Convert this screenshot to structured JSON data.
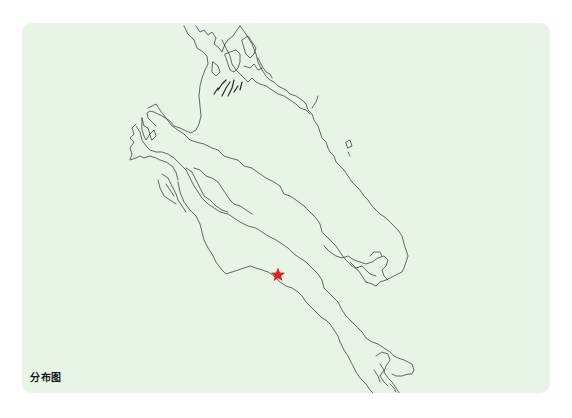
{
  "map": {
    "label": "分布图",
    "panel_color": "#e7f4e6",
    "coast_color": "#2b2b2b",
    "marker": {
      "shape": "star",
      "color": "#d9241f",
      "x": 278,
      "y": 275
    }
  }
}
